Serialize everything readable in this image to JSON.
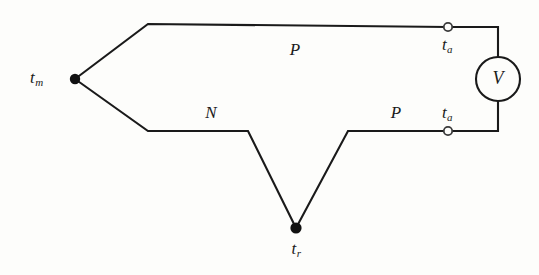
{
  "diagram": {
    "background_color": "#fdfdfb",
    "line_color": "#1a1a1a",
    "junctions": {
      "measuring": {
        "label": "t",
        "subscript": "m",
        "type": "filled-dot",
        "x": 75,
        "y": 79
      },
      "reference": {
        "label": "t",
        "subscript": "r",
        "type": "filled-dot",
        "x": 296,
        "y": 228
      }
    },
    "terminals": [
      {
        "name": "upper-terminal",
        "label": "t",
        "subscript": "a",
        "type": "open-circle",
        "x": 448,
        "y": 27
      },
      {
        "name": "lower-terminal",
        "label": "t",
        "subscript": "a",
        "type": "open-circle",
        "x": 448,
        "y": 131
      }
    ],
    "wire_labels": [
      {
        "name": "upper-wire-label",
        "text": "P",
        "x": 295,
        "y": 50
      },
      {
        "name": "lower-left-wire-label",
        "text": "N",
        "x": 211,
        "y": 113
      },
      {
        "name": "lower-right-wire-label",
        "text": "P",
        "x": 396,
        "y": 113
      }
    ],
    "meter": {
      "label": "V",
      "cx": 498,
      "cy": 79,
      "r": 22
    },
    "paths": {
      "upper_wire": "M 75,79 L 148,24 L 448,27 L 498,27 L 498,57",
      "lower_wire": "M 75,79 L 148,131 L 248,131 L 296,228 L 348,131 L 448,131 L 498,131 L 498,101"
    }
  }
}
